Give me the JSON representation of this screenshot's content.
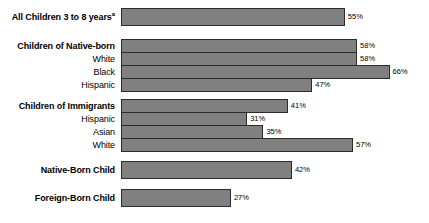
{
  "chart_data": {
    "type": "bar",
    "orientation": "horizontal",
    "title": "",
    "subtitle": "",
    "xlabel": "",
    "ylabel": "",
    "xlim": [
      0,
      74
    ],
    "grid": false,
    "legend": null,
    "value_suffix": "%",
    "categories": [
      "All Children 3 to 8 years",
      "Children of Native-born",
      "White",
      "Black",
      "Hispanic",
      "Children of Immigrants",
      "Hispanic",
      "Asian",
      "White",
      "Native-Born Child",
      "Foreign-Born Child"
    ],
    "values": [
      55,
      58,
      58,
      66,
      47,
      41,
      31,
      35,
      57,
      42,
      27
    ],
    "bar_color": "#808080",
    "bar_border_color": "#2b2b2b"
  },
  "rows": [
    {
      "label": "All Children 3 to 8 years",
      "superscript": "a",
      "value": 55,
      "value_label": "55%",
      "bold": true,
      "top": 8,
      "height": 18
    },
    {
      "label": "Children of Native-born",
      "superscript": "",
      "value": 58,
      "value_label": "58%",
      "bold": true,
      "top": 39,
      "height": 14
    },
    {
      "label": "White",
      "superscript": "",
      "value": 58,
      "value_label": "58%",
      "bold": false,
      "top": 52,
      "height": 14
    },
    {
      "label": "Black",
      "superscript": "",
      "value": 66,
      "value_label": "66%",
      "bold": false,
      "top": 65,
      "height": 14
    },
    {
      "label": "Hispanic",
      "superscript": "",
      "value": 47,
      "value_label": "47%",
      "bold": false,
      "top": 78,
      "height": 14
    },
    {
      "label": "Children of Immigrants",
      "superscript": "",
      "value": 41,
      "value_label": "41%",
      "bold": true,
      "top": 99,
      "height": 14
    },
    {
      "label": "Hispanic",
      "superscript": "",
      "value": 31,
      "value_label": "31%",
      "bold": false,
      "top": 112,
      "height": 14
    },
    {
      "label": "Asian",
      "superscript": "",
      "value": 35,
      "value_label": "35%",
      "bold": false,
      "top": 125,
      "height": 14
    },
    {
      "label": "White",
      "superscript": "",
      "value": 57,
      "value_label": "57%",
      "bold": false,
      "top": 138,
      "height": 14
    },
    {
      "label": "Native-Born Child",
      "superscript": "",
      "value": 42,
      "value_label": "42%",
      "bold": true,
      "top": 161,
      "height": 18
    },
    {
      "label": "Foreign-Born Child",
      "superscript": "",
      "value": 27,
      "value_label": "27%",
      "bold": true,
      "top": 189,
      "height": 18
    }
  ],
  "scale": {
    "px_per_percent": 4.07
  }
}
